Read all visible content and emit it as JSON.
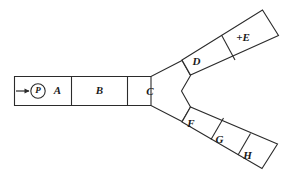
{
  "diagram": {
    "background_color": "#ffffff",
    "line_color": "#2b2b2b",
    "inlet": {
      "marker_label": "P",
      "marker_shape": "circle",
      "arrow_direction": "right",
      "arrow_name": "inlet-flow-arrow"
    },
    "trunk": {
      "name": "main-trunk",
      "segments": [
        {
          "id": "A",
          "label": "A"
        },
        {
          "id": "B",
          "label": "B"
        },
        {
          "id": "C",
          "label": "C"
        }
      ]
    },
    "upper_branch": {
      "name": "upper-branch",
      "segments": [
        {
          "id": "D",
          "label": "D"
        },
        {
          "id": "E",
          "label": "+E"
        }
      ]
    },
    "lower_branch": {
      "name": "lower-branch",
      "segments": [
        {
          "id": "F",
          "label": "F"
        },
        {
          "id": "G",
          "label": "G"
        },
        {
          "id": "H",
          "label": "H"
        }
      ]
    }
  }
}
